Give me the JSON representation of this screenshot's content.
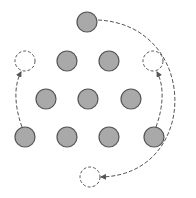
{
  "diagram": {
    "title": "",
    "colors": {
      "background": "#ffffff",
      "coin_fill": "#a9a9a9",
      "coin_stroke": "#555555",
      "empty_stroke": "#555555",
      "arrow": "#555555"
    },
    "radius": 10,
    "coins": [
      {
        "id": "c-top",
        "x": 87,
        "y": 22,
        "state": "moved"
      },
      {
        "id": "c-r2-2",
        "x": 67,
        "y": 61,
        "state": "filled"
      },
      {
        "id": "c-r2-3",
        "x": 109,
        "y": 61,
        "state": "filled"
      },
      {
        "id": "c-r3-1",
        "x": 46,
        "y": 99,
        "state": "filled"
      },
      {
        "id": "c-r3-2",
        "x": 88,
        "y": 99,
        "state": "filled"
      },
      {
        "id": "c-r3-3",
        "x": 131,
        "y": 99,
        "state": "filled"
      },
      {
        "id": "c-r4-1",
        "x": 25,
        "y": 137,
        "state": "moved"
      },
      {
        "id": "c-r4-2",
        "x": 67,
        "y": 137,
        "state": "filled"
      },
      {
        "id": "c-r4-3",
        "x": 109,
        "y": 137,
        "state": "filled"
      },
      {
        "id": "c-r4-4",
        "x": 154,
        "y": 137,
        "state": "moved"
      }
    ],
    "targets": [
      {
        "id": "t-left",
        "x": 25,
        "y": 61
      },
      {
        "id": "t-right",
        "x": 153,
        "y": 61
      },
      {
        "id": "t-bottom",
        "x": 90,
        "y": 177
      }
    ],
    "moves": [
      {
        "from": "c-top",
        "to": "t-bottom",
        "path": "M98 20 C 200 25, 200 175, 101 177"
      },
      {
        "from": "c-r4-1",
        "to": "t-left",
        "path": "M22 127 C 14 105, 14 85, 21 72"
      },
      {
        "from": "c-r4-4",
        "to": "t-right",
        "path": "M156 127 C 164 105, 164 85, 157 72"
      }
    ]
  }
}
